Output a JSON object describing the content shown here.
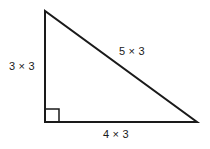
{
  "figure": {
    "shape": "right triangle",
    "background_color": "#ffffff",
    "stroke_color": "#1a1a1a",
    "text_color": "#1a1a1a"
  },
  "labels": {
    "vertical_leg": "3 × 3",
    "hypotenuse": "5 × 3",
    "horizontal_leg": "4 × 3"
  },
  "geometry": {
    "apex": {
      "x": 45,
      "y": 11
    },
    "right_angle_vertex": {
      "x": 45,
      "y": 122
    },
    "bottom_right_vertex": {
      "x": 197,
      "y": 122
    },
    "right_angle_marker_size": 13,
    "stroke_width": 2
  }
}
